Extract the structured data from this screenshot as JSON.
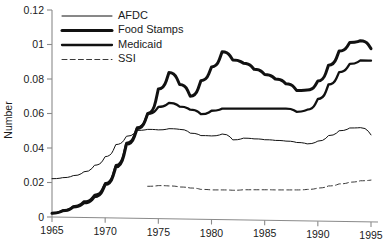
{
  "chart_data": {
    "type": "line",
    "title": "",
    "xlabel": "",
    "ylabel": "Number",
    "xlim": [
      1965,
      1995
    ],
    "ylim": [
      0,
      0.12
    ],
    "grid": false,
    "legend_position": "top-left",
    "x_ticks": [
      "1965",
      "1970",
      "1975",
      "1980",
      "1985",
      "1990",
      "1995"
    ],
    "x_tick_values": [
      1965,
      1970,
      1975,
      1980,
      1985,
      1990,
      1995
    ],
    "y_ticks": [
      "0",
      "0.02",
      "0.04",
      "0.06",
      "0.08",
      "01",
      "0.12"
    ],
    "y_tick_values": [
      0,
      0.02,
      0.04,
      0.06,
      0.08,
      0.1,
      0.12
    ],
    "x": [
      1965,
      1966,
      1967,
      1968,
      1969,
      1970,
      1971,
      1972,
      1973,
      1974,
      1975,
      1976,
      1977,
      1978,
      1979,
      1980,
      1981,
      1982,
      1983,
      1984,
      1985,
      1986,
      1987,
      1988,
      1989,
      1990,
      1991,
      1992,
      1993,
      1994,
      1995
    ],
    "series": [
      {
        "name": "AFDC",
        "style": "thin-solid",
        "color": "#111111",
        "x": [
          1965,
          1966,
          1967,
          1968,
          1969,
          1970,
          1971,
          1972,
          1973,
          1974,
          1975,
          1976,
          1977,
          1978,
          1979,
          1980,
          1981,
          1982,
          1983,
          1984,
          1985,
          1986,
          1987,
          1988,
          1989,
          1990,
          1991,
          1992,
          1993,
          1994,
          1995
        ],
        "values": [
          0.0222,
          0.0228,
          0.024,
          0.0262,
          0.03,
          0.035,
          0.042,
          0.0468,
          0.0502,
          0.0508,
          0.0505,
          0.0512,
          0.0508,
          0.0486,
          0.0472,
          0.047,
          0.0481,
          0.0447,
          0.0457,
          0.0453,
          0.0448,
          0.0444,
          0.044,
          0.0432,
          0.0424,
          0.044,
          0.0472,
          0.05,
          0.0516,
          0.0518,
          0.0476
        ]
      },
      {
        "name": "Food Stamps",
        "style": "thick-solid",
        "color": "#111111",
        "x": [
          1965,
          1966,
          1967,
          1968,
          1969,
          1970,
          1971,
          1972,
          1973,
          1974,
          1975,
          1976,
          1977,
          1978,
          1979,
          1980,
          1981,
          1982,
          1983,
          1984,
          1985,
          1986,
          1987,
          1988,
          1989,
          1990,
          1991,
          1992,
          1993,
          1994,
          1995
        ],
        "values": [
          0.0022,
          0.0036,
          0.0058,
          0.0082,
          0.0118,
          0.0188,
          0.029,
          0.0422,
          0.0512,
          0.06,
          0.0742,
          0.0838,
          0.0768,
          0.07,
          0.079,
          0.087,
          0.0958,
          0.091,
          0.0892,
          0.0856,
          0.0826,
          0.08,
          0.0772,
          0.0734,
          0.0736,
          0.0788,
          0.088,
          0.0962,
          0.1012,
          0.1022,
          0.0976
        ]
      },
      {
        "name": "Medicaid",
        "style": "medium-solid",
        "color": "#111111",
        "x": [
          1965,
          1966,
          1967,
          1968,
          1969,
          1970,
          1971,
          1972,
          1973,
          1974,
          1975,
          1976,
          1977,
          1978,
          1979,
          1980,
          1981,
          1982,
          1983,
          1984,
          1985,
          1986,
          1987,
          1988,
          1989,
          1990,
          1991,
          1992,
          1993,
          1994,
          1995
        ],
        "values": [
          0.0022,
          0.0038,
          0.0062,
          0.009,
          0.0128,
          0.0196,
          0.03,
          0.043,
          0.052,
          0.0598,
          0.0638,
          0.0662,
          0.064,
          0.0622,
          0.0596,
          0.0616,
          0.0628,
          0.0628,
          0.0628,
          0.0628,
          0.0628,
          0.0628,
          0.0628,
          0.061,
          0.0622,
          0.0684,
          0.0768,
          0.084,
          0.0888,
          0.0908,
          0.0906
        ]
      },
      {
        "name": "SSI",
        "style": "dashed",
        "color": "#3a3a3a",
        "x": [
          1974,
          1975,
          1976,
          1977,
          1978,
          1979,
          1980,
          1981,
          1982,
          1983,
          1984,
          1985,
          1986,
          1987,
          1988,
          1989,
          1990,
          1991,
          1992,
          1993,
          1994,
          1995
        ],
        "values": [
          0.0178,
          0.0182,
          0.018,
          0.0174,
          0.0168,
          0.016,
          0.0157,
          0.0157,
          0.0155,
          0.0158,
          0.0158,
          0.0158,
          0.0157,
          0.0157,
          0.0157,
          0.016,
          0.0168,
          0.018,
          0.0192,
          0.0202,
          0.021,
          0.0214
        ]
      }
    ],
    "legend": [
      {
        "label": "AFDC",
        "style": "thin-solid"
      },
      {
        "label": "Food Stamps",
        "style": "thick-solid"
      },
      {
        "label": "Medicaid",
        "style": "medium-solid"
      },
      {
        "label": "SSI",
        "style": "dashed"
      }
    ]
  }
}
